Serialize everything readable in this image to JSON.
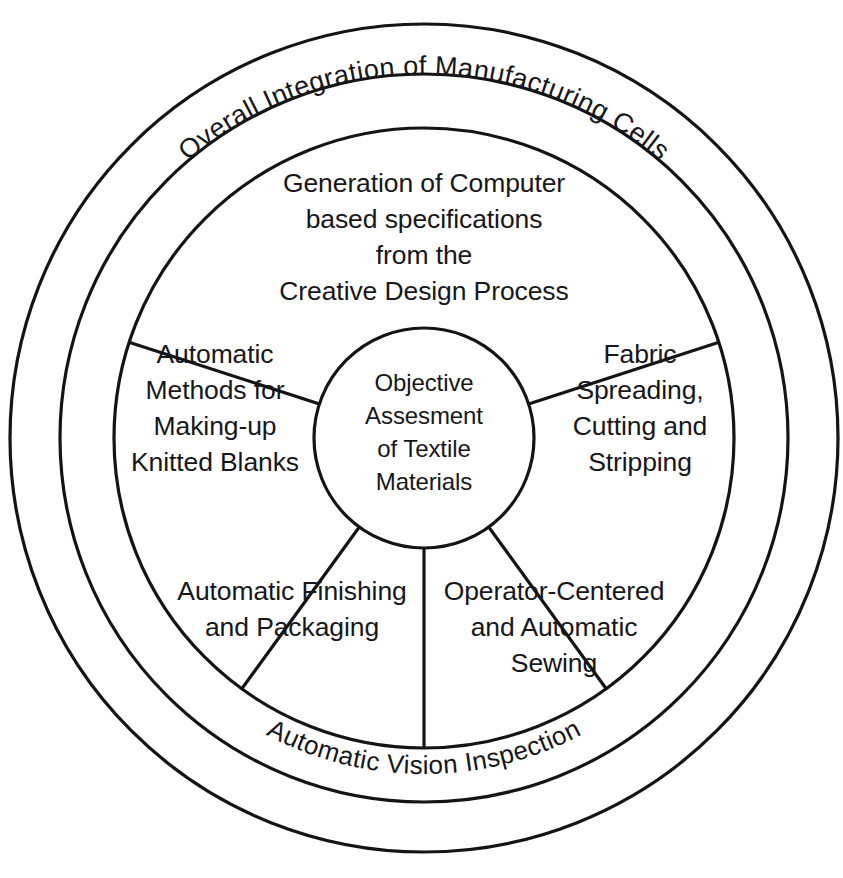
{
  "diagram": {
    "type": "concentric-ring-wheel",
    "background_color": "#ffffff",
    "line_color": "#141414",
    "text_color": "#17171a",
    "outer_ring": {
      "label": "Overall Integration of Manufacturing Cells",
      "position": "top-arc"
    },
    "middle_ring": {
      "label": "Automatic Vision Inspection",
      "position": "bottom-arc"
    },
    "hub": {
      "lines": [
        "Objective",
        "Assesment",
        "of Textile",
        "Materials"
      ]
    },
    "sectors": [
      {
        "id": "generation-of-computer-based-specifications",
        "position": "top",
        "lines": [
          "Generation of Computer",
          "based specifications",
          "from the",
          "Creative Design Process"
        ]
      },
      {
        "id": "fabric-spreading-cutting-stripping",
        "position": "right",
        "lines": [
          "Fabric",
          "Spreading,",
          "Cutting and",
          "Stripping"
        ]
      },
      {
        "id": "operator-centered-and-automatic-sewing",
        "position": "bottom-right",
        "lines": [
          "Operator-Centered",
          "and Automatic",
          "Sewing"
        ]
      },
      {
        "id": "automatic-finishing-and-packaging",
        "position": "bottom-left",
        "lines": [
          "Automatic Finishing",
          "and Packaging"
        ]
      },
      {
        "id": "automatic-methods-for-making-up-knitted-blanks",
        "position": "left",
        "lines": [
          "Automatic",
          "Methods for",
          "Making-up",
          "Knitted Blanks"
        ]
      }
    ]
  }
}
